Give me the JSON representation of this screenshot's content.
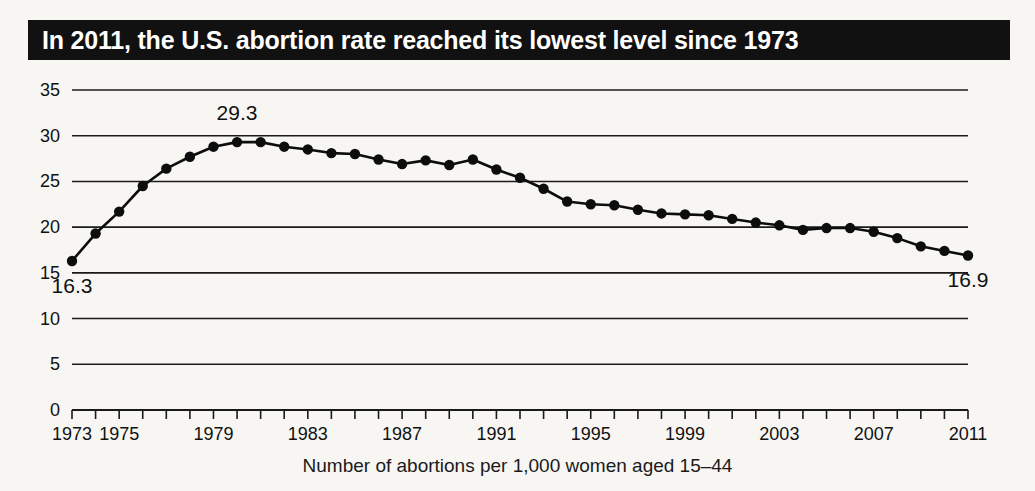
{
  "title": "In 2011, the U.S. abortion rate reached its lowest level since 1973",
  "caption": "Number of abortions per 1,000 women aged 15–44",
  "annotations": {
    "first_value": "16.3",
    "peak_value": "29.3",
    "last_value": "16.9"
  },
  "colors": {
    "banner_background": "#111111",
    "banner_text": "#ffffff",
    "line": "#0d0d0d",
    "grid": "#1a1a1a",
    "page_background": "#f7f6f3"
  },
  "chart_data": {
    "type": "line",
    "title": "In 2011, the U.S. abortion rate reached its lowest level since 1973",
    "xlabel": "Number of abortions per 1,000 women aged 15–44",
    "ylabel": "",
    "xlim": [
      1973,
      2011
    ],
    "ylim": [
      0,
      35
    ],
    "yticks": [
      0,
      5,
      10,
      15,
      20,
      25,
      30,
      35
    ],
    "ytick_labels": [
      "0",
      "5",
      "10",
      "15",
      "20",
      "25",
      "30",
      "35"
    ],
    "xticks": [
      1973,
      1974,
      1975,
      1976,
      1977,
      1978,
      1979,
      1980,
      1981,
      1982,
      1983,
      1984,
      1985,
      1986,
      1987,
      1988,
      1989,
      1990,
      1991,
      1992,
      1993,
      1994,
      1995,
      1996,
      1997,
      1998,
      1999,
      2000,
      2001,
      2002,
      2003,
      2004,
      2005,
      2006,
      2007,
      2008,
      2009,
      2010,
      2011
    ],
    "xtick_labels": [
      "1973",
      "1975",
      "1979",
      "1983",
      "1987",
      "1991",
      "1995",
      "1999",
      "2003",
      "2007",
      "2011"
    ],
    "labeled_xticks": [
      1973,
      1975,
      1979,
      1983,
      1987,
      1991,
      1995,
      1999,
      2003,
      2007,
      2011
    ],
    "grid": true,
    "legend": "none",
    "markers": true,
    "x": [
      1973,
      1974,
      1975,
      1976,
      1977,
      1978,
      1979,
      1980,
      1981,
      1982,
      1983,
      1984,
      1985,
      1986,
      1987,
      1988,
      1989,
      1990,
      1991,
      1992,
      1993,
      1994,
      1995,
      1996,
      1997,
      1998,
      1999,
      2000,
      2001,
      2002,
      2003,
      2004,
      2005,
      2006,
      2007,
      2008,
      2009,
      2010,
      2011
    ],
    "values": [
      16.3,
      19.3,
      21.7,
      24.5,
      26.4,
      27.7,
      28.8,
      29.3,
      29.3,
      28.8,
      28.5,
      28.1,
      28.0,
      27.4,
      26.9,
      27.3,
      26.8,
      27.4,
      26.3,
      25.4,
      24.2,
      22.8,
      22.5,
      22.4,
      21.9,
      21.5,
      21.4,
      21.3,
      20.9,
      20.5,
      20.2,
      19.7,
      19.9,
      19.9,
      19.5,
      18.8,
      17.9,
      17.4,
      16.9
    ],
    "annotations": [
      {
        "x": 1973,
        "value": 16.3,
        "label": "16.3",
        "position": "below"
      },
      {
        "x": 1980,
        "value": 29.3,
        "label": "29.3",
        "position": "above"
      },
      {
        "x": 2011,
        "value": 16.9,
        "label": "16.9",
        "position": "below"
      }
    ]
  }
}
